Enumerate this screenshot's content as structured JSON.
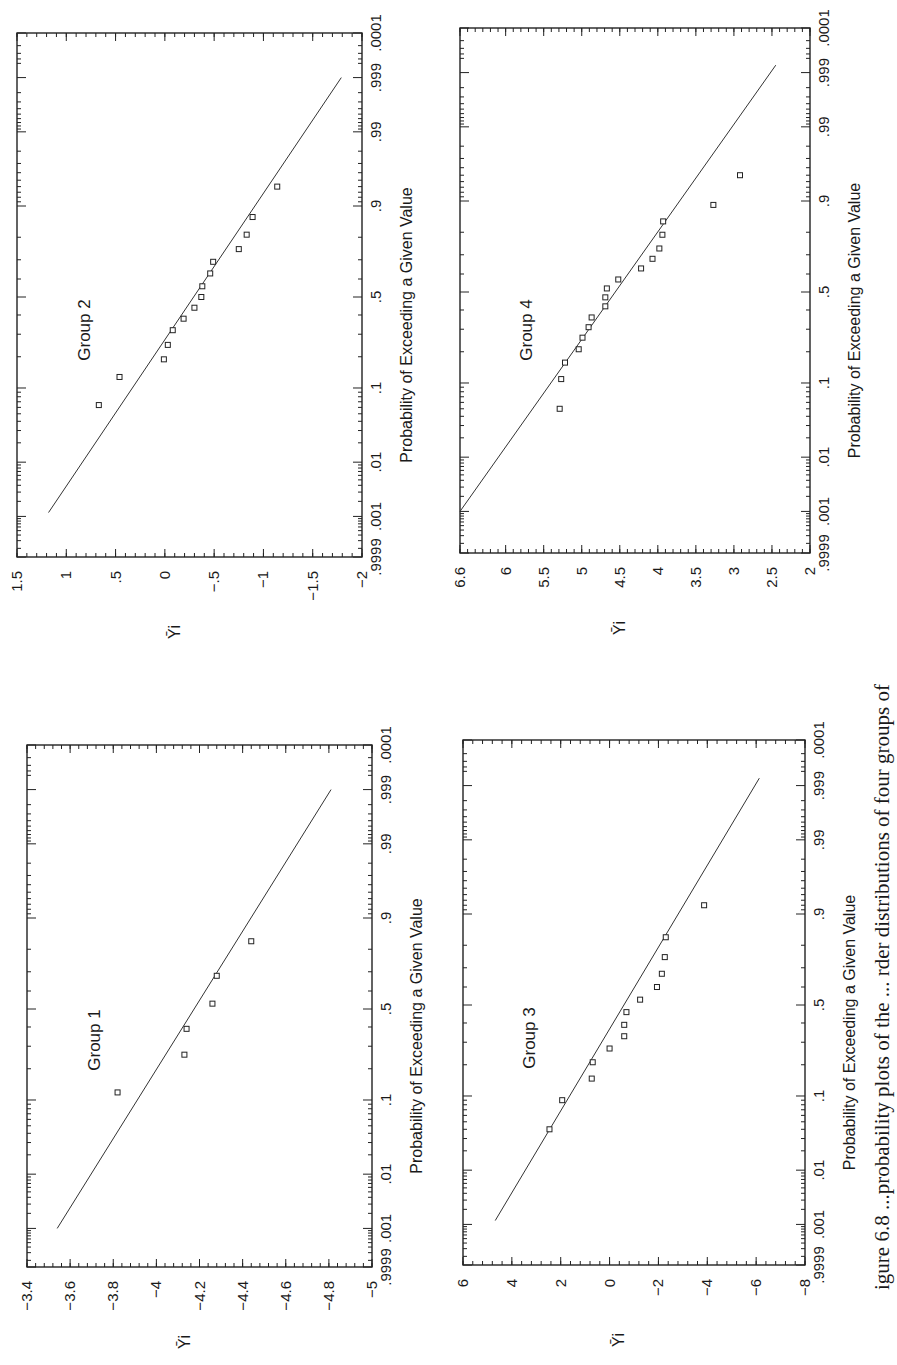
{
  "figure": {
    "orientation": "rotated-90-ccw",
    "caption_partial": "igure 6.8   ...probability plots of the ... rder distributions of four groups of",
    "y_symbol": "Ȳi",
    "xlabel": "Probability of Exceeding a Given Value",
    "prob_ticks": [
      ".9999",
      ".999",
      ".99",
      ".9",
      ".5",
      ".1",
      ".01",
      ".001",
      ".0001"
    ],
    "prob_tick_values": [
      0.9999,
      0.999,
      0.99,
      0.9,
      0.5,
      0.1,
      0.01,
      0.001,
      0.0001
    ]
  },
  "chart_data": [
    {
      "type": "scatter",
      "title": "Group 1",
      "xlabel": "Probability of Exceeding a Given Value",
      "ylabel": "Ȳi",
      "x_scale": "normal-probability",
      "xlim": [
        0.9999,
        0.0001
      ],
      "ylim": [
        -5,
        -3.4
      ],
      "y_ticks": [
        -3.4,
        -3.6,
        -3.8,
        -4,
        -4.2,
        -4.4,
        -4.6,
        -4.8,
        -5
      ],
      "y_tick_labels": [
        "-3.4",
        "-3.6",
        "-3.8",
        "-4",
        "-4.2",
        "-4.4",
        "-4.6",
        "-4.8",
        "-5"
      ],
      "points": [
        {
          "p": 0.12,
          "y": -3.82
        },
        {
          "p": 0.26,
          "y": -4.13
        },
        {
          "p": 0.39,
          "y": -4.14
        },
        {
          "p": 0.53,
          "y": -4.26
        },
        {
          "p": 0.68,
          "y": -4.28
        },
        {
          "p": 0.83,
          "y": -4.44
        }
      ],
      "fit_line": [
        {
          "p": 0.001,
          "y": -3.54
        },
        {
          "p": 0.999,
          "y": -4.81
        }
      ]
    },
    {
      "type": "scatter",
      "title": "Group 2",
      "xlabel": "Probability of Exceeding a Given Value",
      "ylabel": "Ȳi",
      "x_scale": "normal-probability",
      "xlim": [
        0.9999,
        0.0001
      ],
      "ylim": [
        -2,
        1.5
      ],
      "y_ticks": [
        1.5,
        1,
        0.5,
        0,
        -0.5,
        -1,
        -1.5,
        -2
      ],
      "y_tick_labels": [
        "1.5",
        "1",
        ".5",
        "0",
        "-.5",
        "-1",
        "-1.5",
        "-2"
      ],
      "points": [
        {
          "p": 0.064,
          "y": 0.67
        },
        {
          "p": 0.13,
          "y": 0.46
        },
        {
          "p": 0.19,
          "y": 0.01
        },
        {
          "p": 0.25,
          "y": -0.03
        },
        {
          "p": 0.32,
          "y": -0.08
        },
        {
          "p": 0.38,
          "y": -0.19
        },
        {
          "p": 0.44,
          "y": -0.3
        },
        {
          "p": 0.5,
          "y": -0.37
        },
        {
          "p": 0.56,
          "y": -0.38
        },
        {
          "p": 0.63,
          "y": -0.46
        },
        {
          "p": 0.69,
          "y": -0.49
        },
        {
          "p": 0.75,
          "y": -0.75
        },
        {
          "p": 0.81,
          "y": -0.83
        },
        {
          "p": 0.87,
          "y": -0.89
        },
        {
          "p": 0.94,
          "y": -1.14
        }
      ],
      "fit_line": [
        {
          "p": 0.0012,
          "y": 1.18
        },
        {
          "p": 0.999,
          "y": -1.79
        }
      ]
    },
    {
      "type": "scatter",
      "title": "Group 3",
      "xlabel": "Probability of Exceeding a Given Value",
      "ylabel": "Ȳi",
      "x_scale": "normal-probability",
      "xlim": [
        0.9999,
        0.0001
      ],
      "ylim": [
        -8,
        6
      ],
      "y_ticks": [
        6,
        4,
        2,
        0,
        -2,
        -4,
        -6,
        -8
      ],
      "y_tick_labels": [
        "6",
        "4",
        "2",
        "0",
        "-2",
        "-4",
        "-6",
        "-8"
      ],
      "points": [
        {
          "p": 0.04,
          "y": 2.46
        },
        {
          "p": 0.09,
          "y": 1.94
        },
        {
          "p": 0.15,
          "y": 0.73
        },
        {
          "p": 0.21,
          "y": 0.69
        },
        {
          "p": 0.27,
          "y": 0.0
        },
        {
          "p": 0.33,
          "y": -0.6
        },
        {
          "p": 0.39,
          "y": -0.6
        },
        {
          "p": 0.46,
          "y": -0.69
        },
        {
          "p": 0.53,
          "y": -1.25
        },
        {
          "p": 0.6,
          "y": -1.94
        },
        {
          "p": 0.67,
          "y": -2.14
        },
        {
          "p": 0.75,
          "y": -2.26
        },
        {
          "p": 0.83,
          "y": -2.3
        },
        {
          "p": 0.92,
          "y": -3.87
        }
      ],
      "fit_line": [
        {
          "p": 0.0012,
          "y": 4.68
        },
        {
          "p": 0.9993,
          "y": -6.13
        }
      ]
    },
    {
      "type": "scatter",
      "title": "Group 4",
      "xlabel": "Probability of Exceeding a Given Value",
      "ylabel": "Ȳi",
      "x_scale": "normal-probability",
      "xlim": [
        0.9999,
        0.0001
      ],
      "ylim": [
        2,
        6.6
      ],
      "y_ticks": [
        6.6,
        6,
        5.5,
        5,
        4.5,
        4,
        3.5,
        3,
        2.5,
        2
      ],
      "y_tick_labels": [
        "6.6",
        "6",
        "5.5",
        "5",
        "4.5",
        "4",
        "3.5",
        "3",
        "2.5",
        "2"
      ],
      "points": [
        {
          "p": 0.05,
          "y": 5.29
        },
        {
          "p": 0.11,
          "y": 5.27
        },
        {
          "p": 0.16,
          "y": 5.22
        },
        {
          "p": 0.21,
          "y": 5.04
        },
        {
          "p": 0.26,
          "y": 4.99
        },
        {
          "p": 0.31,
          "y": 4.91
        },
        {
          "p": 0.36,
          "y": 4.87
        },
        {
          "p": 0.42,
          "y": 4.69
        },
        {
          "p": 0.47,
          "y": 4.69
        },
        {
          "p": 0.52,
          "y": 4.67
        },
        {
          "p": 0.57,
          "y": 4.52
        },
        {
          "p": 0.63,
          "y": 4.22
        },
        {
          "p": 0.68,
          "y": 4.07
        },
        {
          "p": 0.73,
          "y": 3.98
        },
        {
          "p": 0.79,
          "y": 3.94
        },
        {
          "p": 0.84,
          "y": 3.93
        },
        {
          "p": 0.89,
          "y": 3.27
        },
        {
          "p": 0.95,
          "y": 2.92
        }
      ],
      "fit_line": [
        {
          "p": 0.001,
          "y": 6.6
        },
        {
          "p": 0.9993,
          "y": 2.45
        }
      ]
    }
  ]
}
